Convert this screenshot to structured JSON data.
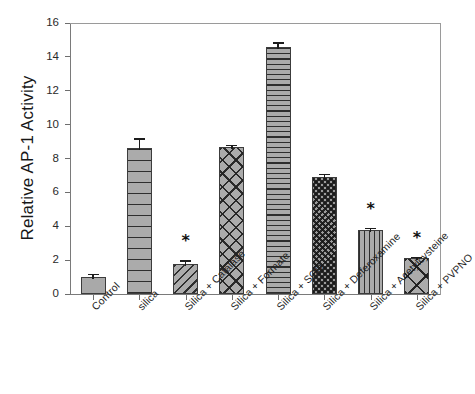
{
  "chart_data": {
    "type": "bar",
    "title": "",
    "subtitle": "",
    "xlabel": "",
    "ylabel": "Relative AP-1 Activity",
    "ylim": [
      0,
      16
    ],
    "yticks": [
      0,
      2,
      4,
      6,
      8,
      10,
      12,
      14,
      16
    ],
    "ytick_labels": [
      "0",
      "2",
      "4",
      "6",
      "8",
      "10",
      "12",
      "14",
      "16"
    ],
    "grid": false,
    "legend": "none",
    "categories": [
      "Control",
      "silica",
      "Silica + Catalase",
      "Silica + Formate",
      "Silica + SOD",
      "Silica + Deferoxamine",
      "Silica + Acetylcysteine",
      "Silica + PVPNO"
    ],
    "values": [
      1.0,
      8.6,
      1.8,
      8.65,
      14.6,
      6.9,
      3.8,
      2.1
    ],
    "errors": [
      0.2,
      0.6,
      0.2,
      0.15,
      0.25,
      0.2,
      0.1,
      0.1
    ],
    "annotations": [
      "",
      "",
      "*",
      "",
      "",
      "",
      "*",
      "*"
    ],
    "bar_patterns": [
      "solid-gray",
      "horizontal-lines-wide",
      "diagonal-lines",
      "crosshatch-diagonal",
      "horizontal-lines-dense",
      "dense-checker-dark",
      "vertical-lines",
      "large-diamond-crosshatch"
    ],
    "bar_fill_color": "#a8a8a8",
    "bar_edge_color": "#3c3c3c",
    "axis_color": "#7a7a7a",
    "text_color": "#1a1a1a"
  }
}
